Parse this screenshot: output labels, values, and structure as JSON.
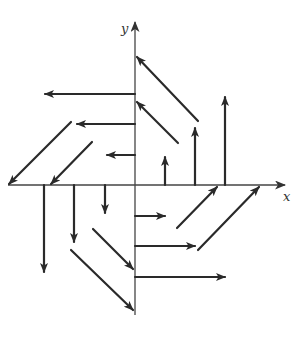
{
  "diagram": {
    "type": "vector-field",
    "colors": {
      "background": "#ffffff",
      "ink": "#2a2a2a",
      "axis": "#444444"
    },
    "axes": {
      "x": {
        "label": "x",
        "from": [
          8,
          185
        ],
        "to": [
          285,
          185
        ],
        "label_pos": [
          283,
          201
        ]
      },
      "y": {
        "label": "y",
        "from": [
          135,
          315
        ],
        "to": [
          135,
          22
        ],
        "label_pos": [
          121,
          33
        ]
      }
    },
    "vectors": [
      {
        "quadrant": "I",
        "kind": "vertical-up",
        "from": [
          165,
          185
        ],
        "to": [
          165,
          157
        ]
      },
      {
        "quadrant": "I",
        "kind": "vertical-up",
        "from": [
          195,
          185
        ],
        "to": [
          195,
          128
        ]
      },
      {
        "quadrant": "I",
        "kind": "vertical-up",
        "from": [
          225,
          185
        ],
        "to": [
          225,
          97
        ]
      },
      {
        "quadrant": "I",
        "kind": "diagonal-up-left",
        "from": [
          198,
          121
        ],
        "to": [
          137,
          57
        ]
      },
      {
        "quadrant": "I",
        "kind": "diagonal-up-left",
        "from": [
          178,
          143
        ],
        "to": [
          137,
          102
        ]
      },
      {
        "quadrant": "II",
        "kind": "horizontal-left",
        "from": [
          135,
          94
        ],
        "to": [
          45,
          94
        ]
      },
      {
        "quadrant": "II",
        "kind": "horizontal-left",
        "from": [
          135,
          124
        ],
        "to": [
          77,
          124
        ]
      },
      {
        "quadrant": "II",
        "kind": "horizontal-left",
        "from": [
          135,
          155
        ],
        "to": [
          107,
          155
        ]
      },
      {
        "quadrant": "II",
        "kind": "diagonal-down-left",
        "from": [
          71,
          122
        ],
        "to": [
          9,
          184
        ]
      },
      {
        "quadrant": "II",
        "kind": "diagonal-down-left",
        "from": [
          92,
          142
        ],
        "to": [
          51,
          184
        ]
      },
      {
        "quadrant": "III",
        "kind": "vertical-down",
        "from": [
          44,
          185
        ],
        "to": [
          44,
          272
        ]
      },
      {
        "quadrant": "III",
        "kind": "vertical-down",
        "from": [
          74,
          185
        ],
        "to": [
          74,
          242
        ]
      },
      {
        "quadrant": "III",
        "kind": "vertical-down",
        "from": [
          105,
          185
        ],
        "to": [
          105,
          213
        ]
      },
      {
        "quadrant": "III",
        "kind": "diagonal-down-right",
        "from": [
          93,
          229
        ],
        "to": [
          133,
          269
        ]
      },
      {
        "quadrant": "III",
        "kind": "diagonal-down-right",
        "from": [
          71,
          250
        ],
        "to": [
          133,
          310
        ]
      },
      {
        "quadrant": "IV",
        "kind": "horizontal-right",
        "from": [
          135,
          216
        ],
        "to": [
          165,
          216
        ]
      },
      {
        "quadrant": "IV",
        "kind": "horizontal-right",
        "from": [
          135,
          246
        ],
        "to": [
          195,
          246
        ]
      },
      {
        "quadrant": "IV",
        "kind": "horizontal-right",
        "from": [
          135,
          277
        ],
        "to": [
          225,
          277
        ]
      },
      {
        "quadrant": "IV",
        "kind": "diagonal-up-right",
        "from": [
          177,
          228
        ],
        "to": [
          217,
          187
        ]
      },
      {
        "quadrant": "IV",
        "kind": "diagonal-up-right",
        "from": [
          198,
          250
        ],
        "to": [
          259,
          187
        ]
      }
    ]
  }
}
